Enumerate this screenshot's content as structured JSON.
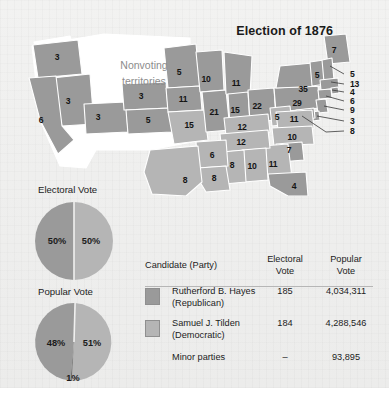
{
  "figure": {
    "title": "Election of 1876",
    "territories_label_line1": "Nonvoting",
    "territories_label_line2": "territories"
  },
  "colors": {
    "hayes_fill": "#9a9a9a",
    "tilden_fill": "#b5b5b5",
    "nonvoting_fill": "#ffffff",
    "border": "#ffffff",
    "panel_bg": "#efefee",
    "text": "#1c1c1c"
  },
  "map": {
    "state_votes": [
      {
        "state": "Oregon",
        "votes": "3",
        "x": 57,
        "y": 57
      },
      {
        "state": "Nevada",
        "votes": "3",
        "x": 68,
        "y": 101
      },
      {
        "state": "California",
        "votes": "6",
        "x": 41,
        "y": 120
      },
      {
        "state": "Colorado",
        "votes": "3",
        "x": 98,
        "y": 117
      },
      {
        "state": "Nebraska",
        "votes": "3",
        "x": 141,
        "y": 96
      },
      {
        "state": "Kansas",
        "votes": "5",
        "x": 148,
        "y": 120
      },
      {
        "state": "Minnesota",
        "votes": "5",
        "x": 179,
        "y": 72
      },
      {
        "state": "Iowa",
        "votes": "11",
        "x": 183,
        "y": 99
      },
      {
        "state": "Missouri",
        "votes": "15",
        "x": 189,
        "y": 125
      },
      {
        "state": "Wisconsin",
        "votes": "10",
        "x": 206,
        "y": 79
      },
      {
        "state": "Illinois",
        "votes": "21",
        "x": 214,
        "y": 112
      },
      {
        "state": "Michigan",
        "votes": "11",
        "x": 236,
        "y": 83
      },
      {
        "state": "Indiana",
        "votes": "15",
        "x": 235,
        "y": 110
      },
      {
        "state": "Ohio",
        "votes": "22",
        "x": 257,
        "y": 106
      },
      {
        "state": "West Virginia",
        "votes": "5",
        "x": 277,
        "y": 117
      },
      {
        "state": "Kentucky",
        "votes": "12",
        "x": 242,
        "y": 127
      },
      {
        "state": "Tennessee",
        "votes": "12",
        "x": 241,
        "y": 142
      },
      {
        "state": "Arkansas",
        "votes": "6",
        "x": 212,
        "y": 155
      },
      {
        "state": "Texas",
        "votes": "8",
        "x": 185,
        "y": 180
      },
      {
        "state": "Louisiana",
        "votes": "8",
        "x": 214,
        "y": 178
      },
      {
        "state": "Mississippi",
        "votes": "8",
        "x": 232,
        "y": 165
      },
      {
        "state": "Alabama",
        "votes": "10",
        "x": 252,
        "y": 166
      },
      {
        "state": "Georgia",
        "votes": "11",
        "x": 273,
        "y": 164
      },
      {
        "state": "Florida",
        "votes": "4",
        "x": 294,
        "y": 186
      },
      {
        "state": "South Carolina",
        "votes": "7",
        "x": 289,
        "y": 150
      },
      {
        "state": "North Carolina",
        "votes": "10",
        "x": 292,
        "y": 137
      },
      {
        "state": "Virginia",
        "votes": "11",
        "x": 294,
        "y": 119
      },
      {
        "state": "New York",
        "votes": "35",
        "x": 303,
        "y": 89
      },
      {
        "state": "Pennsylvania",
        "votes": "29",
        "x": 297,
        "y": 103
      },
      {
        "state": "Vermont",
        "votes": "5",
        "x": 317,
        "y": 75
      },
      {
        "state": "Maine",
        "votes": "7",
        "x": 334,
        "y": 50
      }
    ],
    "callouts": [
      {
        "state": "New Hampshire",
        "votes": "5",
        "x": 350,
        "y": 74
      },
      {
        "state": "Massachusetts",
        "votes": "13",
        "x": 350,
        "y": 84
      },
      {
        "state": "Rhode Island",
        "votes": "4",
        "x": 350,
        "y": 92
      },
      {
        "state": "Connecticut",
        "votes": "6",
        "x": 350,
        "y": 101
      },
      {
        "state": "New Jersey",
        "votes": "9",
        "x": 350,
        "y": 110
      },
      {
        "state": "Delaware",
        "votes": "3",
        "x": 350,
        "y": 121
      },
      {
        "state": "Maryland",
        "votes": "8",
        "x": 350,
        "y": 131
      }
    ]
  },
  "charts": [
    {
      "id": "electoral-vote-pie",
      "title": "Electoral Vote",
      "type": "pie",
      "slices": [
        {
          "label": "50%",
          "value": 50,
          "party": "Hayes"
        },
        {
          "label": "50%",
          "value": 50,
          "party": "Tilden"
        }
      ]
    },
    {
      "id": "popular-vote-pie",
      "title": "Popular Vote",
      "type": "pie",
      "slices": [
        {
          "label": "48%",
          "value": 48,
          "party": "Hayes"
        },
        {
          "label": "51%",
          "value": 51,
          "party": "Tilden"
        },
        {
          "label": "1%",
          "value": 1,
          "party": "Minor parties"
        }
      ]
    }
  ],
  "chart_data": {
    "type": "pie",
    "title": "Election of 1876",
    "charts": [
      {
        "title": "Electoral Vote",
        "type": "pie",
        "categories": [
          "Rutherford B. Hayes (Republican)",
          "Samuel J. Tilden (Democratic)"
        ],
        "values": [
          50,
          50
        ],
        "labels": [
          "50%",
          "50%"
        ],
        "units": "percent"
      },
      {
        "title": "Popular Vote",
        "type": "pie",
        "categories": [
          "Rutherford B. Hayes (Republican)",
          "Samuel J. Tilden (Democratic)",
          "Minor parties"
        ],
        "values": [
          48,
          51,
          1
        ],
        "labels": [
          "48%",
          "51%",
          "1%"
        ],
        "units": "percent"
      }
    ],
    "table": {
      "columns": [
        "Candidate (Party)",
        "Electoral Vote",
        "Popular Vote"
      ],
      "rows": [
        [
          "Rutherford B. Hayes (Republican)",
          185,
          4034311
        ],
        [
          "Samuel J. Tilden (Democratic)",
          184,
          4288546
        ],
        [
          "Minor parties",
          null,
          93895
        ]
      ]
    },
    "map": {
      "type": "choropleth",
      "metric": "electoral votes by state",
      "states": {
        "Oregon": 3,
        "Nevada": 3,
        "California": 6,
        "Colorado": 3,
        "Nebraska": 3,
        "Kansas": 5,
        "Minnesota": 5,
        "Iowa": 11,
        "Missouri": 15,
        "Wisconsin": 10,
        "Illinois": 21,
        "Michigan": 11,
        "Indiana": 15,
        "Ohio": 22,
        "West Virginia": 5,
        "Kentucky": 12,
        "Tennessee": 12,
        "Arkansas": 6,
        "Texas": 8,
        "Louisiana": 8,
        "Mississippi": 8,
        "Alabama": 10,
        "Georgia": 11,
        "Florida": 4,
        "South Carolina": 7,
        "North Carolina": 10,
        "Virginia": 11,
        "New York": 35,
        "Pennsylvania": 29,
        "Vermont": 5,
        "Maine": 7,
        "New Hampshire": 5,
        "Massachusetts": 13,
        "Rhode Island": 4,
        "Connecticut": 6,
        "New Jersey": 9,
        "Delaware": 3,
        "Maryland": 8
      }
    }
  },
  "table": {
    "headers": {
      "candidate": "Candidate (Party)",
      "electoral_line1": "Electoral",
      "electoral_line2": "Vote",
      "popular_line1": "Popular",
      "popular_line2": "Vote"
    },
    "rows": [
      {
        "name": "Rutherford B. Hayes",
        "party": "(Republican)",
        "electoral": "185",
        "popular": "4,034,311",
        "swatch": "#9a9a9a"
      },
      {
        "name": "Samuel J. Tilden",
        "party": "(Democratic)",
        "electoral": "184",
        "popular": "4,288,546",
        "swatch": "#b5b5b5"
      },
      {
        "name": "Minor parties",
        "party": "",
        "electoral": "–",
        "popular": "93,895",
        "swatch": ""
      }
    ]
  }
}
